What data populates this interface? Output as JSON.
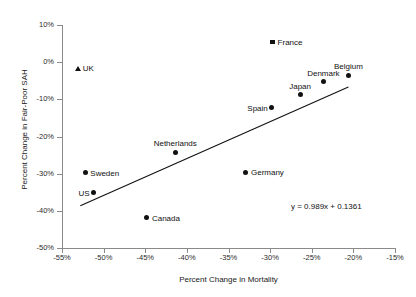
{
  "chart_data": {
    "type": "scatter",
    "title": "",
    "xlabel": "Percent Change in Mortality",
    "ylabel": "Percent Change in Fair-Poor SAH",
    "xlim": [
      -55,
      -15
    ],
    "ylim": [
      -50,
      10
    ],
    "xticks": [
      "-55%",
      "-50%",
      "-45%",
      "-40%",
      "-35%",
      "-30%",
      "-25%",
      "-20%",
      "-15%"
    ],
    "xtick_values": [
      -55,
      -50,
      -45,
      -40,
      -35,
      -30,
      -25,
      -20,
      -15
    ],
    "yticks": [
      "10%",
      "0%",
      "-10%",
      "-20%",
      "-30%",
      "-40%",
      "-50%"
    ],
    "ytick_values": [
      10,
      0,
      -10,
      -20,
      -30,
      -40,
      -50
    ],
    "grid": false,
    "legend": "none",
    "annotations": [
      {
        "text": "y = 0.989x + 0.1361",
        "x": -27.5,
        "y": -39.0
      }
    ],
    "trendline": {
      "equation": "y = 0.989x + 0.1361",
      "slope": 0.989,
      "intercept": 0.1361,
      "x_start": -52.8,
      "x_end": -20.6,
      "y_start": -38.6,
      "y_end": -6.7
    },
    "points": [
      {
        "label": "UK",
        "x": -53.1,
        "y": -1.6,
        "marker": "triangle",
        "label_pos": "right"
      },
      {
        "label": "France",
        "x": -29.7,
        "y": 5.4,
        "marker": "square",
        "label_pos": "right"
      },
      {
        "label": "Belgium",
        "x": -20.6,
        "y": -3.5,
        "marker": "circle",
        "label_pos": "above"
      },
      {
        "label": "Denmark",
        "x": -23.6,
        "y": -5.3,
        "marker": "circle",
        "label_pos": "above"
      },
      {
        "label": "Japan",
        "x": -26.4,
        "y": -8.8,
        "marker": "circle",
        "label_pos": "above"
      },
      {
        "label": "Spain",
        "x": -29.8,
        "y": -12.3,
        "marker": "circle",
        "label_pos": "left"
      },
      {
        "label": "Netherlands",
        "x": -41.4,
        "y": -24.2,
        "marker": "circle",
        "label_pos": "above"
      },
      {
        "label": "Germany",
        "x": -32.9,
        "y": -29.6,
        "marker": "circle",
        "label_pos": "right"
      },
      {
        "label": "Sweden",
        "x": -52.2,
        "y": -29.8,
        "marker": "circle",
        "label_pos": "right"
      },
      {
        "label": "US",
        "x": -51.2,
        "y": -35.2,
        "marker": "circle",
        "label_pos": "left"
      },
      {
        "label": "Canada",
        "x": -44.8,
        "y": -41.9,
        "marker": "circle",
        "label_pos": "right"
      }
    ]
  },
  "colors": {
    "marker": "#111111",
    "axis": "#8a8a8a",
    "text": "#1a1a1a",
    "background": "#ffffff"
  }
}
